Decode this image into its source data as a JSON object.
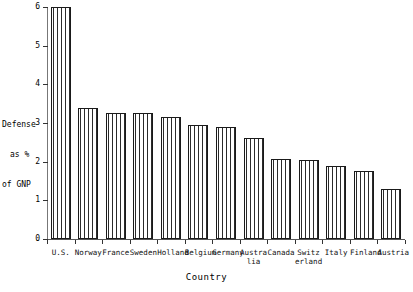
{
  "chart_data": {
    "type": "bar",
    "title": "",
    "xlabel": "Country",
    "ylabel": "Defense as % of GNP",
    "ylabel_lines": [
      "Defense",
      "as %",
      "of GNP"
    ],
    "ylim": [
      0,
      6
    ],
    "yticks": [
      0,
      1,
      2,
      3,
      4,
      5,
      6
    ],
    "ytick_labels": [
      "0",
      "1",
      "2",
      "3",
      "4",
      "5",
      "6"
    ],
    "grid": false,
    "legend": false,
    "categories": [
      "U.S.",
      "Norway",
      "France",
      "Sweden",
      "Holland",
      "Belgium",
      "Germany",
      "Australia",
      "Canada",
      "Switzerland",
      "Italy",
      "Finland",
      "Austria"
    ],
    "category_label_lines": [
      [
        "U.S.",
        ""
      ],
      [
        "Norway",
        ""
      ],
      [
        "France",
        ""
      ],
      [
        "Sweden",
        ""
      ],
      [
        "Holland",
        ""
      ],
      [
        "Belgium",
        ""
      ],
      [
        "Germany",
        ""
      ],
      [
        "Austra",
        "lia"
      ],
      [
        "Canada",
        ""
      ],
      [
        "Switz",
        "erland"
      ],
      [
        "Italy",
        ""
      ],
      [
        "Finland",
        ""
      ],
      [
        "Austria",
        ""
      ]
    ],
    "values": [
      6.0,
      3.38,
      3.26,
      3.25,
      3.15,
      2.95,
      2.9,
      2.62,
      2.06,
      2.05,
      1.88,
      1.75,
      1.3
    ],
    "bar_fill": "vertical-hatch",
    "bar_edge_color": "#1a1a1a",
    "bar_hatch_color": "#2b2b2b",
    "background_color": "#ffffff"
  }
}
